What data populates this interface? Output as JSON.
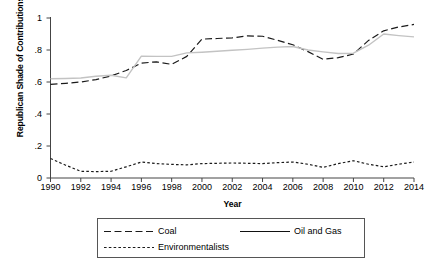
{
  "chart_data": {
    "type": "line",
    "title": "",
    "xlabel": "Year",
    "ylabel": "Republican Shade of Contributions",
    "xlim": [
      1990,
      2014
    ],
    "ylim": [
      0,
      1
    ],
    "grid": false,
    "legend_position": "bottom",
    "x": [
      1990,
      1991,
      1992,
      1993,
      1994,
      1995,
      1996,
      1997,
      1998,
      1999,
      2000,
      2001,
      2002,
      2003,
      2004,
      2005,
      2006,
      2007,
      2008,
      2009,
      2010,
      2011,
      2012,
      2013,
      2014
    ],
    "xticks": [
      1990,
      1992,
      1994,
      1996,
      1998,
      2000,
      2002,
      2004,
      2006,
      2008,
      2010,
      2012,
      2014
    ],
    "xtick_labels": [
      "1990",
      "1992",
      "1994",
      "1996",
      "1998",
      "2000",
      "2002",
      "2004",
      "2006",
      "2008",
      "2010",
      "2012",
      "2014"
    ],
    "yticks": [
      0,
      0.2,
      0.4,
      0.6,
      0.8,
      1
    ],
    "ytick_labels": [
      "0",
      ".2",
      ".4",
      ".6",
      ".8",
      "1"
    ],
    "series": [
      {
        "name": "Coal",
        "style": "long-dash",
        "color": "#1a1a1a",
        "values": [
          0.585,
          0.592,
          0.6,
          0.615,
          0.638,
          0.672,
          0.718,
          0.726,
          0.71,
          0.76,
          0.868,
          0.872,
          0.876,
          0.888,
          0.886,
          0.86,
          0.833,
          0.79,
          0.742,
          0.752,
          0.775,
          0.86,
          0.92,
          0.944,
          0.96
        ]
      },
      {
        "name": "Oil and Gas",
        "style": "solid",
        "color": "#c3c3c3",
        "values": [
          0.62,
          0.622,
          0.625,
          0.636,
          0.642,
          0.626,
          0.762,
          0.76,
          0.76,
          0.782,
          0.786,
          0.792,
          0.798,
          0.804,
          0.812,
          0.818,
          0.822,
          0.8,
          0.788,
          0.778,
          0.78,
          0.83,
          0.9,
          0.89,
          0.882
        ]
      },
      {
        "name": "Environmentalists",
        "style": "short-dash",
        "color": "#1a1a1a",
        "values": [
          0.122,
          0.08,
          0.042,
          0.04,
          0.042,
          0.07,
          0.1,
          0.09,
          0.085,
          0.082,
          0.09,
          0.092,
          0.094,
          0.092,
          0.09,
          0.096,
          0.1,
          0.086,
          0.066,
          0.09,
          0.108,
          0.086,
          0.07,
          0.086,
          0.1
        ]
      }
    ]
  },
  "legend": {
    "entries": [
      {
        "label": "Coal"
      },
      {
        "label": "Oil and Gas"
      },
      {
        "label": "Environmentalists"
      }
    ]
  },
  "axes": {
    "axis_color": "#444444"
  }
}
